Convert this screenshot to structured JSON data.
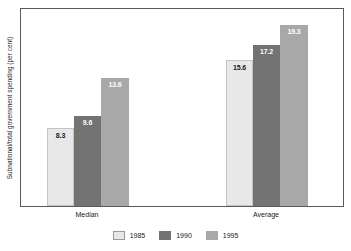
{
  "chart_data": {
    "type": "bar",
    "title": "",
    "subtitle": "",
    "xlabel": "",
    "ylabel": "Subnational/total government spending (per cent)",
    "categories": [
      "Median",
      "Average"
    ],
    "series": [
      {
        "name": "1985",
        "color": "#e8e8e8",
        "label_color": "dark",
        "values": [
          8.3,
          19.3
        ]
      },
      {
        "name": "1990",
        "color": "#737373",
        "label_color": "light",
        "values": [
          9.6,
          17.2
        ]
      },
      {
        "name": "1995",
        "color": "#a8a8a8",
        "label_color": "light",
        "values": [
          13.6,
          19.3
        ]
      }
    ],
    "data_labels": {
      "Median": [
        "8.3",
        "9.6",
        "13.6"
      ],
      "Average": [
        "15.6",
        "17.2",
        "19.3"
      ]
    },
    "ylim": [
      0,
      21.0
    ],
    "grid": false,
    "axis_ticks": false,
    "legend_position": "bottom-center"
  },
  "axis": {
    "y_title": "Subnational/total government spending (per cent)",
    "category_median": "Median",
    "category_average": "Average"
  },
  "bars": {
    "median": {
      "y1985": {
        "value": "8.3",
        "height_pct": 39.5
      },
      "y1990": {
        "value": "9.6",
        "height_pct": 45.7
      },
      "y1995": {
        "value": "13.6",
        "height_pct": 64.8
      }
    },
    "average": {
      "y1985": {
        "value": "15.6",
        "height_pct": 74.3
      },
      "y1990": {
        "value": "17.2",
        "height_pct": 81.9
      },
      "y1995": {
        "value": "19.3",
        "height_pct": 91.9
      }
    }
  },
  "legend": {
    "items": [
      {
        "label": "1985",
        "color": "#e8e8e8"
      },
      {
        "label": "1990",
        "color": "#737373"
      },
      {
        "label": "1995",
        "color": "#a8a8a8"
      }
    ]
  },
  "colors": {
    "series_1985": "#e8e8e8",
    "series_1990": "#737373",
    "series_1995": "#a8a8a8",
    "frame": "#5a5a5a",
    "text": "#1a1a1a",
    "background": "#ffffff"
  }
}
